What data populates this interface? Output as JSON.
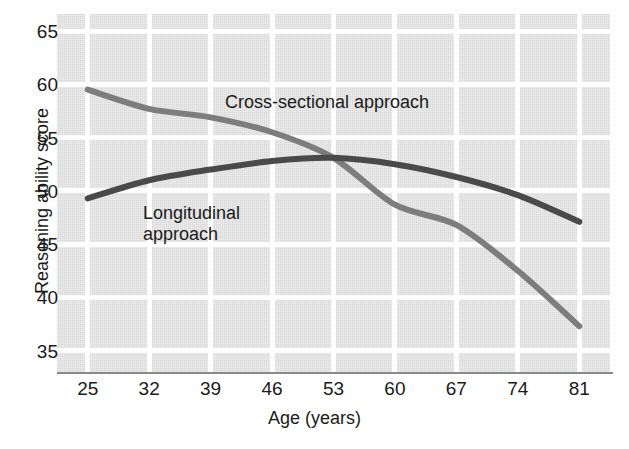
{
  "chart_data": {
    "type": "line",
    "title": "",
    "xlabel": "Age (years)",
    "ylabel": "Reasoning ability score",
    "x": [
      25,
      32,
      39,
      46,
      53,
      60,
      67,
      74,
      81
    ],
    "xticklabels": [
      "25",
      "32",
      "39",
      "46",
      "53",
      "60",
      "67",
      "74",
      "81"
    ],
    "yticklabels": [
      "65",
      "60",
      "55",
      "50",
      "45",
      "40",
      "35"
    ],
    "yticks": [
      65,
      60,
      55,
      50,
      45,
      40,
      35
    ],
    "xlim": [
      21.5,
      84.5
    ],
    "ylim": [
      33.0,
      66.6
    ],
    "grid": true,
    "legend": "in-plot annotations",
    "series": [
      {
        "name": "Cross-sectional approach",
        "color": "#7d7d7d",
        "values": [
          59.5,
          57.7,
          56.9,
          55.5,
          53.1,
          48.7,
          46.8,
          42.5,
          37.3
        ]
      },
      {
        "name": "Longitudinal approach",
        "color": "#4a4a4a",
        "values": [
          49.3,
          51.0,
          52.0,
          52.8,
          53.1,
          52.5,
          51.3,
          49.6,
          47.1
        ]
      }
    ],
    "annotations": [
      {
        "text": "Cross-sectional approach",
        "series": "Cross-sectional approach"
      },
      {
        "text": "Longitudinal\napproach",
        "series": "Longitudinal approach"
      }
    ]
  },
  "axes": {
    "y_label": "Reasoning ability score",
    "x_label": "Age (years)",
    "y_ticks": [
      "65",
      "60",
      "55",
      "50",
      "45",
      "40",
      "35"
    ],
    "x_ticks": [
      "25",
      "32",
      "39",
      "46",
      "53",
      "60",
      "67",
      "74",
      "81"
    ]
  },
  "labels": {
    "cross_sectional": "Cross-sectional approach",
    "longitudinal": "Longitudinal\napproach"
  },
  "colors": {
    "plot_background": "#d9d9d9",
    "gridline": "#ffffff",
    "cross_sectional_line": "#7d7d7d",
    "longitudinal_line": "#4a4a4a",
    "text": "#1a1a1a",
    "axis": "#8a8a8a"
  }
}
